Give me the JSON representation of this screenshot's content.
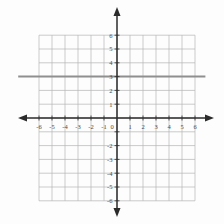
{
  "chart_data": {
    "type": "line",
    "title": "",
    "xlabel": "",
    "ylabel": "",
    "x_range": [
      -6,
      6
    ],
    "y_range": [
      -6,
      6
    ],
    "grid": true,
    "tick_step": 1,
    "x_tick_labels": [
      "-6",
      "-5",
      "-4",
      "-3",
      "-2",
      "-1",
      "0",
      "1",
      "2",
      "3",
      "4",
      "5",
      "6"
    ],
    "y_tick_labels_positive": [
      "1",
      "2",
      "3",
      "4",
      "5",
      "6"
    ],
    "y_tick_labels_negative": [
      "-2",
      "-3",
      "-4",
      "-5",
      "-6"
    ],
    "series": [
      {
        "name": "horizontal-line",
        "equation": "y = 3",
        "y": 3,
        "points": [
          [
            -7.6,
            3
          ],
          [
            6.8,
            3
          ]
        ],
        "color": "#8f8f8f",
        "width": 2
      }
    ],
    "colors": {
      "grid_line": "#b5b5b5",
      "axis": "#2b2b2b",
      "label": "#4a4a4a",
      "background": "#fdfdfd"
    }
  }
}
